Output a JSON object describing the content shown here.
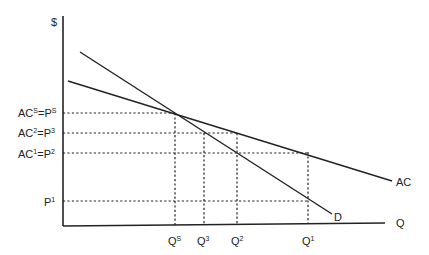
{
  "axes": {
    "y_label": "$",
    "x_label": "Q"
  },
  "curves": {
    "ac_label": "AC",
    "d_label": "D"
  },
  "y_ticks": [
    {
      "base1": "AC",
      "sup1": "S",
      "eq": "=",
      "base2": "P",
      "sup2": "S"
    },
    {
      "base1": "AC",
      "sup1": "2",
      "eq": "=",
      "base2": "P",
      "sup2": "3"
    },
    {
      "base1": "AC",
      "sup1": "1",
      "eq": "=",
      "base2": "P",
      "sup2": "2"
    },
    {
      "base1": "P",
      "sup1": "1"
    }
  ],
  "x_ticks": [
    {
      "base": "Q",
      "sup": "S"
    },
    {
      "base": "Q",
      "sup": "3"
    },
    {
      "base": "Q",
      "sup": "2"
    },
    {
      "base": "Q",
      "sup": "1"
    }
  ]
}
